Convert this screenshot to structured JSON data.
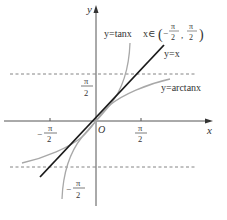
{
  "figure": {
    "axes": {
      "x_label": "x",
      "y_label": "y",
      "origin_label": "O"
    },
    "ticks": {
      "x_pos": {
        "num": "π",
        "den": "2"
      },
      "x_neg": {
        "sign": "−",
        "num": "π",
        "den": "2"
      },
      "y_pos": {
        "num": "π",
        "den": "2"
      },
      "y_neg": {
        "sign": "−",
        "num": "π",
        "den": "2"
      }
    },
    "curves": {
      "tan": {
        "label": "y=tanx",
        "domain_label_prefix": "x∈",
        "domain_open": "(",
        "domain_sign": "−",
        "domain_num": "π",
        "domain_den": "2",
        "domain_sep": ",",
        "domain_num2": "π",
        "domain_den2": "2",
        "domain_close": ")",
        "color": "#a8a8a8"
      },
      "identity": {
        "label": "y=x",
        "color": "#1a1a1a"
      },
      "arctan": {
        "label": "y=arctanx",
        "color": "#a8a8a8"
      }
    },
    "asymptotes": {
      "color": "#555555",
      "style": "dashed"
    }
  }
}
